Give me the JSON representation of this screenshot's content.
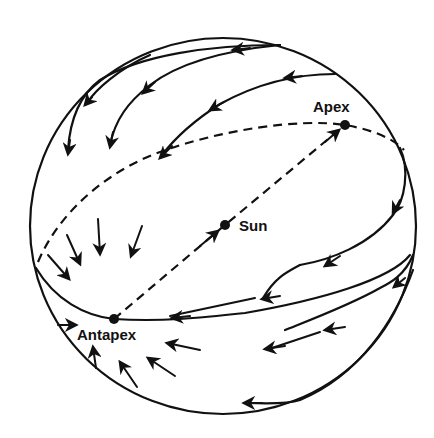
{
  "diagram": {
    "type": "celestial-sphere-solar-motion",
    "colors": {
      "ink": "#111111",
      "background": "#ffffff"
    },
    "labels": {
      "apex": "Apex",
      "sun": "Sun",
      "antapex": "Antapex"
    },
    "points": {
      "apex": {
        "x": 345,
        "y": 125
      },
      "sun": {
        "x": 225,
        "y": 225
      },
      "antapex": {
        "x": 114,
        "y": 319
      }
    },
    "sphere": {
      "cx": 223,
      "cy": 226,
      "rx": 193,
      "ry": 188
    }
  }
}
